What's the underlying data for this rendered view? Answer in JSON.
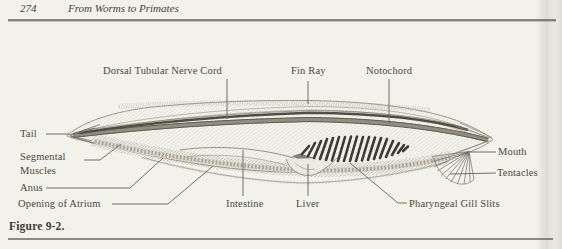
{
  "page": {
    "header": {
      "page_number": "274",
      "title": "From Worms to Primates"
    },
    "caption": "Figure 9-2.",
    "figure": {
      "subject": "labeled lateral-view anatomical diagram of a lancelet (amphioxus)",
      "labels": {
        "dorsal_tubular_nerve_cord": "Dorsal Tubular Nerve Cord",
        "fin_ray": "Fin Ray",
        "notochord": "Notochord",
        "tail": "Tail",
        "segmental_muscles_line1": "Segmental",
        "segmental_muscles_line2": "Muscles",
        "anus": "Anus",
        "opening_of_atrium": "Opening of Atrium",
        "intestine": "Intestine",
        "liver": "Liver",
        "pharyngeal_gill_slits": "Pharyngeal Gill Slits",
        "mouth": "Mouth",
        "tentacles": "Tentacles"
      }
    },
    "colors": {
      "paper": "#f2f1ea",
      "text": "#4c4942",
      "rule": "#85837a",
      "dark_ink": "#3d3a33",
      "line_ink": "#8f8c80"
    }
  }
}
